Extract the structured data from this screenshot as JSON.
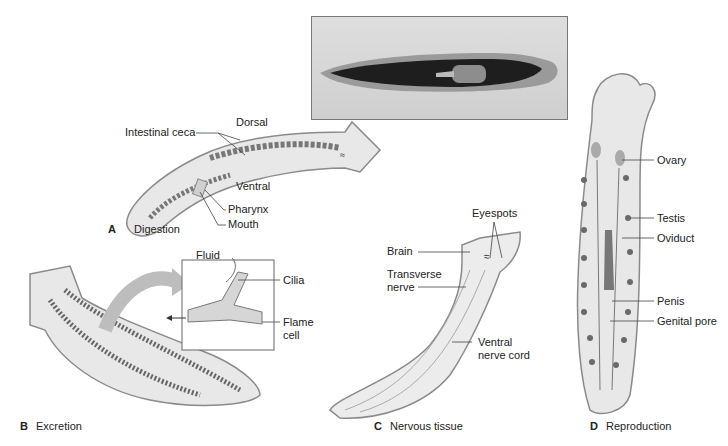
{
  "figure": {
    "photo": {
      "description": "photograph of planarian (dorsal view)"
    },
    "panels": [
      {
        "letter": "A",
        "title": "Digestion",
        "labels": {
          "dorsal": "Dorsal",
          "intestinal_ceca": "Intestinal ceca",
          "ventral": "Ventral",
          "pharynx": "Pharynx",
          "mouth": "Mouth"
        }
      },
      {
        "letter": "B",
        "title": "Excretion",
        "labels": {
          "fluid": "Fluid",
          "cilia": "Cilia",
          "flame_cell_1": "Flame",
          "flame_cell_2": "cell"
        }
      },
      {
        "letter": "C",
        "title": "Nervous tissue",
        "labels": {
          "eyespots": "Eyespots",
          "brain": "Brain",
          "transverse_1": "Transverse",
          "transverse_2": "nerve",
          "ventral_cord_1": "Ventral",
          "ventral_cord_2": "nerve cord"
        }
      },
      {
        "letter": "D",
        "title": "Reproduction",
        "labels": {
          "ovary": "Ovary",
          "testis": "Testis",
          "oviduct": "Oviduct",
          "penis": "Penis",
          "genital_pore": "Genital pore"
        }
      }
    ],
    "colors": {
      "body_fill": "#e8e8e8",
      "body_outline": "#8a8a8a",
      "organ_dark": "#6a6a6a",
      "arrow": "#bdbdbd"
    }
  }
}
